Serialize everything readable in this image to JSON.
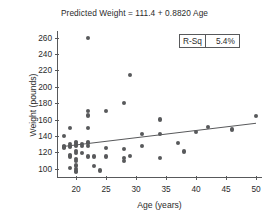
{
  "chart_data": {
    "type": "scatter",
    "title": "Predicted Weight = 111.4 + 0.8820 Age",
    "xlabel": "Age (years)",
    "ylabel": "Weight (pounds)",
    "xlim": [
      17,
      51
    ],
    "ylim": [
      90,
      268
    ],
    "xticks": [
      20,
      25,
      30,
      35,
      40,
      45,
      50
    ],
    "yticks": [
      100,
      120,
      140,
      160,
      180,
      200,
      220,
      240,
      260
    ],
    "grid": false,
    "legend": "none",
    "annotations": [
      {
        "name": "r-squared",
        "key": "R-Sq",
        "value": "5.4%"
      }
    ],
    "fit_line": {
      "name": "regression-line",
      "equation": "Predicted Weight = 111.4 + 0.8820 Age",
      "intercept": 111.4,
      "slope": 0.882,
      "x_start": 18,
      "x_end": 50,
      "y_start": 127.3,
      "y_end": 155.5
    },
    "series": [
      {
        "name": "observations",
        "marker": "filled-circle",
        "color": "#58595b",
        "points": [
          [
            18,
            140
          ],
          [
            18,
            128
          ],
          [
            18,
            127
          ],
          [
            18,
            126
          ],
          [
            19,
            150
          ],
          [
            19,
            130
          ],
          [
            19,
            128
          ],
          [
            19,
            127
          ],
          [
            19,
            117
          ],
          [
            19,
            115
          ],
          [
            19,
            101
          ],
          [
            20,
            133
          ],
          [
            20,
            131
          ],
          [
            20,
            129
          ],
          [
            20,
            128
          ],
          [
            20,
            122
          ],
          [
            20,
            119
          ],
          [
            20,
            112
          ],
          [
            20,
            110
          ],
          [
            20,
            104
          ],
          [
            20,
            100
          ],
          [
            20,
            97
          ],
          [
            20,
            96
          ],
          [
            21,
            130
          ],
          [
            21,
            128
          ],
          [
            21,
            119
          ],
          [
            22,
            170
          ],
          [
            22,
            165
          ],
          [
            22,
            150
          ],
          [
            22,
            132
          ],
          [
            22,
            131
          ],
          [
            22,
            128
          ],
          [
            22,
            115
          ],
          [
            22,
            259
          ],
          [
            23,
            103
          ],
          [
            23,
            115
          ],
          [
            24,
            98
          ],
          [
            25,
            170
          ],
          [
            25,
            125
          ],
          [
            25,
            115
          ],
          [
            28,
            180
          ],
          [
            28,
            124
          ],
          [
            28,
            113
          ],
          [
            28,
            110
          ],
          [
            29,
            214
          ],
          [
            29,
            116
          ],
          [
            31,
            142
          ],
          [
            31,
            128
          ],
          [
            34,
            160
          ],
          [
            34,
            142
          ],
          [
            34,
            113
          ],
          [
            37,
            131
          ],
          [
            38,
            121
          ],
          [
            40,
            145
          ],
          [
            42,
            151
          ],
          [
            46,
            148
          ],
          [
            50,
            164
          ]
        ]
      }
    ]
  }
}
